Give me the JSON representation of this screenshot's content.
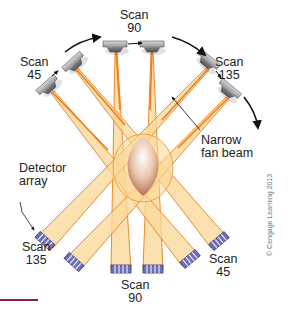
{
  "figure": {
    "type": "CT scanner scan geometry diagram",
    "colors": {
      "beam_fill": "#fbd89a",
      "beam_edge": "#ee8a2a",
      "tube_body": "#a9a9ad",
      "detector": "#6c6fb8",
      "patient": "#b7765f",
      "arrow": "#111111",
      "footer_rule": "#8a1e3c"
    },
    "labels": {
      "scan90_top": {
        "line1": "Scan",
        "line2": "90"
      },
      "scan45_top": {
        "line1": "Scan",
        "line2": "45"
      },
      "scan135_top": {
        "line1": "Scan",
        "line2": "135"
      },
      "narrow_fan_beam": {
        "line1": "Narrow",
        "line2": "fan beam"
      },
      "detector_array": {
        "line1": "Detector",
        "line2": "array"
      },
      "scan135_bottom": {
        "line1": "Scan",
        "line2": "135"
      },
      "scan90_bottom": {
        "line1": "Scan",
        "line2": "90"
      },
      "scan45_bottom": {
        "line1": "Scan",
        "line2": "45"
      }
    },
    "copyright": "© Cengage Learning 2013",
    "scans": [
      {
        "name": "Scan 45",
        "tubes": [
          [
            74,
            66
          ],
          [
            50,
            88
          ]
        ],
        "detectors": [
          [
            188,
            258
          ],
          [
            218,
            240
          ]
        ]
      },
      {
        "name": "Scan 90",
        "tubes": [
          [
            115,
            46
          ],
          [
            152,
            46
          ]
        ],
        "detectors": [
          [
            120,
            268
          ],
          [
            153,
            268
          ]
        ]
      },
      {
        "name": "Scan 135",
        "tubes": [
          [
            208,
            63
          ],
          [
            228,
            92
          ]
        ],
        "detectors": [
          [
            44,
            239
          ],
          [
            73,
            261
          ]
        ]
      }
    ]
  }
}
